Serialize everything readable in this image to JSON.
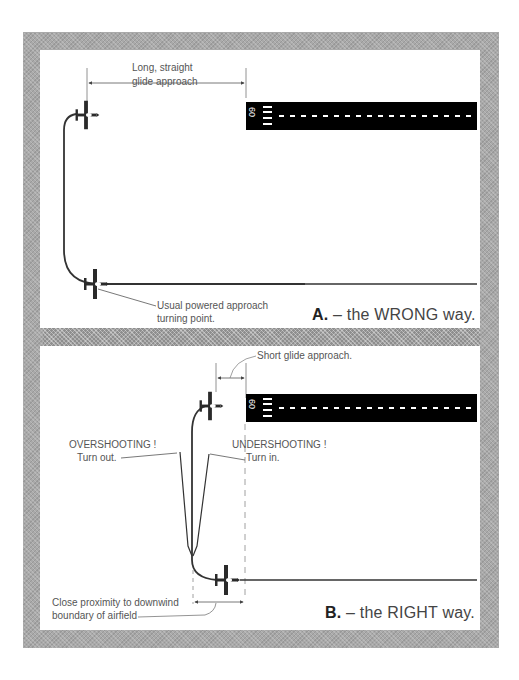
{
  "panel_a": {
    "caption_letter": "A.",
    "caption_text": " – the WRONG way.",
    "label_glide_line1": "Long, straight",
    "label_glide_line2": "glide approach",
    "label_turn_line1": "Usual powered approach",
    "label_turn_line2": "turning point.",
    "runway_number": "60"
  },
  "panel_b": {
    "caption_letter": "B.",
    "caption_text": " – the RIGHT way.",
    "label_short_glide": "Short glide approach.",
    "label_overshoot_line1": "OVERSHOOTING !",
    "label_overshoot_line2": "Turn out.",
    "label_undershoot_line1": "UNDERSHOOTING !",
    "label_undershoot_line2": "Turn in.",
    "label_boundary_line1": "Close proximity to downwind",
    "label_boundary_line2": "boundary of airfield",
    "runway_number": "60"
  },
  "colors": {
    "frame": "#a9a9a9",
    "runway": "#000000",
    "line": "#333333",
    "text": "#555555"
  }
}
